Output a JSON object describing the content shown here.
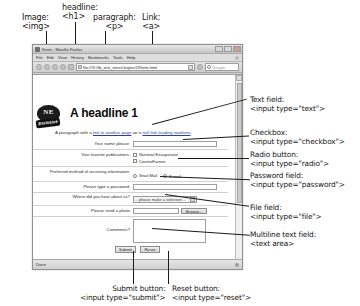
{
  "annotations": {
    "top": [
      {
        "id": "image",
        "line1": "Image:",
        "line2": "<img>"
      },
      {
        "id": "headline",
        "line1": "headline:",
        "line2": "<h1>"
      },
      {
        "id": "paragraph",
        "line1": "paragraph:",
        "line2": "<p>"
      },
      {
        "id": "link",
        "line1": "Link:",
        "line2": "<a>"
      }
    ],
    "right": [
      {
        "id": "text-field",
        "line1": "Text field:",
        "line2": "<input type=\"text\">"
      },
      {
        "id": "checkbox",
        "line1": "Checkbox:",
        "line2": "<input type=\"checkbox\">"
      },
      {
        "id": "radio",
        "line1": "Radio button:",
        "line2": "<input type=\"radio\">"
      },
      {
        "id": "password",
        "line1": "Password field:",
        "line2": "<input type=\"password\">"
      },
      {
        "id": "file",
        "line1": "File field:",
        "line2": "<input type=\"file\">"
      },
      {
        "id": "textarea",
        "line1": "Multiline text field:",
        "line2": "<text area>"
      }
    ],
    "bottom": [
      {
        "id": "submit",
        "line1": "Submit button:",
        "line2": "<input type=\"submit\">"
      },
      {
        "id": "reset",
        "line1": "Reset button:",
        "line2": "<input type=\"reset\">"
      }
    ]
  },
  "browser": {
    "title": "Form - Mozilla Firefox",
    "menus": [
      "File",
      "Edit",
      "View",
      "History",
      "Bookmarks",
      "Tools",
      "Help"
    ],
    "url": "file:///X:/lib_test_sites/chapter13/form.html",
    "search_placeholder": "Google",
    "status": "Done",
    "window_buttons": [
      "minimize",
      "maximize",
      "close"
    ]
  },
  "page": {
    "logo": {
      "monogram": "NE",
      "banner": "Exclusive"
    },
    "headline": "A headline 1",
    "paragraph": {
      "before": "A paragraph with a ",
      "link1": "link to another page",
      "middle": " an a ",
      "link2": "null link leading nowhere",
      "after": "."
    },
    "form": {
      "name": {
        "label": "Your name please:",
        "value": ""
      },
      "publications": {
        "label": "Your favorite publications:",
        "options": [
          "National Exasperator",
          "CosmoFarmer"
        ]
      },
      "contact_method": {
        "label": "Preferred method of receiving information:",
        "options": [
          "Snail Mail",
          "E-mail"
        ]
      },
      "password": {
        "label": "Please type a password:",
        "value": ""
      },
      "referral": {
        "label": "Where did you hear about us?",
        "selected": "-- please make a selection --"
      },
      "photo": {
        "label": "Please send a photo",
        "button": "Browse...",
        "value": ""
      },
      "comments": {
        "label": "Comments?",
        "value": ""
      },
      "submit_label": "Submit",
      "reset_label": "Reset"
    }
  }
}
